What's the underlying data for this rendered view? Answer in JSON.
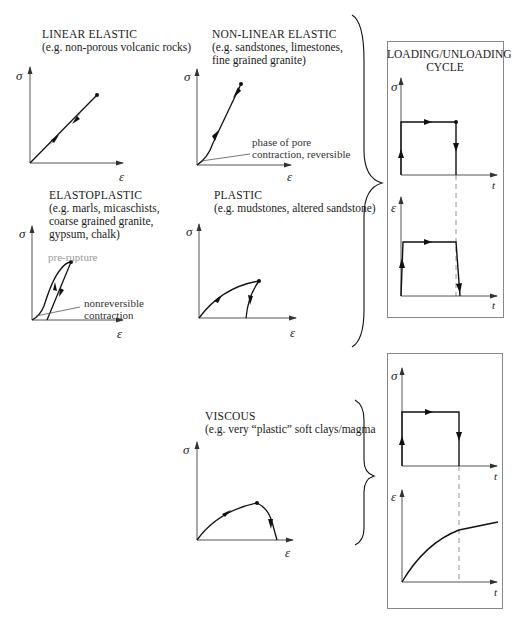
{
  "panels": {
    "linear_elastic": {
      "title": "LINEAR ELASTIC",
      "subtitle": "(e.g. non-porous volcanic rocks)",
      "y_axis": "σ",
      "x_axis": "ε"
    },
    "non_linear_elastic": {
      "title": "NON-LINEAR ELASTIC",
      "subtitle_1": "(e.g. sandstones, limestones,",
      "subtitle_2": "fine grained granite)",
      "annotation_1": "phase of pore",
      "annotation_2": "contraction, reversible",
      "y_axis": "σ",
      "x_axis": "ε"
    },
    "elastoplastic": {
      "title": "ELASTOPLASTIC",
      "subtitle_1": "(e.g. marls, micaschists,",
      "subtitle_2": "coarse grained granite,",
      "subtitle_3": "gypsum, chalk)",
      "annotation_pre_rupture": "pre-rupture",
      "annotation_1": "nonreversible",
      "annotation_2": "contraction",
      "y_axis": "σ",
      "x_axis": "ε"
    },
    "plastic": {
      "title": "PLASTIC",
      "subtitle": "(e.g. mudstones, altered sandstone)",
      "y_axis": "σ",
      "x_axis": "ε"
    },
    "viscous": {
      "title": "VISCOUS",
      "subtitle": "(e.g. very “plastic” soft clays/magma",
      "y_axis": "σ",
      "x_axis": "ε"
    }
  },
  "cycle_box_top": {
    "title_1": "LOADING/UNLOADING",
    "title_2": "CYCLE",
    "stress_axis": "σ",
    "strain_axis": "ε",
    "time_axis": "t"
  },
  "cycle_box_bottom": {
    "stress_axis": "σ",
    "strain_axis": "ε",
    "time_axis": "t"
  },
  "colors": {
    "line": "#111111",
    "axis": "#555555",
    "box_border": "#888888",
    "pre_rupture_text": "#999999"
  }
}
